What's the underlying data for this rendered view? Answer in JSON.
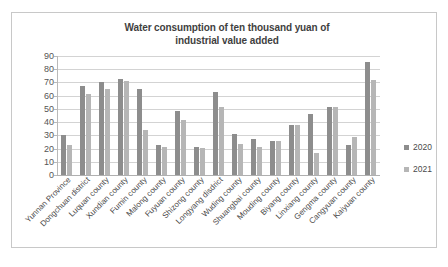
{
  "chart_data": {
    "type": "bar",
    "title": "Water consumption of ten thousand yuan of industrial value added",
    "title_line1": "Water consumption of ten thousand yuan of",
    "title_line2": "industrial value added",
    "xlabel": "",
    "ylabel": "",
    "ylim": [
      0,
      90
    ],
    "ytick_step": 10,
    "yticks": [
      90,
      80,
      70,
      60,
      50,
      40,
      30,
      20,
      10,
      0
    ],
    "grid": true,
    "legend_position": "right",
    "categories": [
      "Yunnan Province",
      "Dongchuan district",
      "Luquan county",
      "Xundian county",
      "Fumin county",
      "Malong county",
      "Fuyuan county",
      "Shizong county",
      "Longyang disdrict",
      "Wuding county",
      "Shuangbai county",
      "Mouding county",
      "Biyang county",
      "Linxiang county",
      "Gengma county",
      "Cangyuan county",
      "Kaiyuan county"
    ],
    "series": [
      {
        "name": "2020",
        "color": "#8d8d8d",
        "values": [
          30.0,
          67.5,
          70.0,
          72.5,
          65.0,
          22.5,
          48.5,
          21.5,
          63.0,
          31.0,
          27.5,
          26.0,
          38.0,
          46.0,
          51.5,
          23.0,
          85.5
        ]
      },
      {
        "name": "2021",
        "color": "#b6b6b6",
        "values": [
          22.5,
          61.5,
          65.0,
          71.0,
          34.0,
          21.5,
          41.5,
          20.5,
          51.5,
          23.5,
          21.0,
          25.5,
          37.5,
          16.5,
          51.5,
          29.0,
          71.5
        ]
      }
    ]
  },
  "legend": {
    "items": [
      {
        "label": "2020"
      },
      {
        "label": "2021"
      }
    ]
  }
}
